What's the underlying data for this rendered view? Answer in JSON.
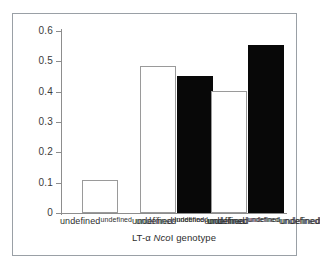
{
  "chart_data": {
    "type": "bar",
    "title": "",
    "xlabel": "LT-α NcoI genotype",
    "ylabel": "",
    "categories": [
      "B*1/B*1",
      "B*1/B*2",
      "B*2/B*2"
    ],
    "series": [
      {
        "name": "open",
        "fill": "white",
        "values": [
          0.109,
          0.485,
          0.403
        ]
      },
      {
        "name": "filled",
        "fill": "black",
        "values": [
          null,
          0.452,
          0.554
        ]
      }
    ],
    "ylim": [
      0,
      0.6
    ],
    "yticks": [
      0,
      0.1,
      0.2,
      0.3,
      0.4,
      0.5,
      0.6
    ],
    "ytick_labels": [
      "0",
      "0.1",
      "0.2",
      "0.3",
      "0.4",
      "0.5",
      "0.6"
    ],
    "grid": false,
    "legend": "none"
  },
  "axis": {
    "ytick_labels": [
      "0.6",
      "0.5",
      "0.4",
      "0.3",
      "0.2",
      "0.1",
      "0"
    ],
    "xlabel_parts": {
      "prefix": "LT-α ",
      "italic": "Nco",
      "suffix": "I genotype"
    }
  },
  "categories": [
    {
      "pre": "B",
      "star": "*",
      "mid": "1/B",
      "star2": "*",
      "post": "1",
      "full": "B*1/B*1"
    },
    {
      "pre": "B",
      "star": "*",
      "mid": "1/B",
      "star2": "*",
      "post": "2",
      "full": "B*1/B*2"
    },
    {
      "pre": "B",
      "star": "*",
      "mid": "2/B",
      "star2": "*",
      "post": "2",
      "full": "B*2/B*2"
    }
  ],
  "colors": {
    "open_bar_fill": "#ffffff",
    "open_bar_stroke": "#9a9a9a",
    "filled_bar": "#080808",
    "axis": "#8d8d8d",
    "frame": "#9aa0a6",
    "text": "#2e2e2e",
    "background": "#ffffff"
  }
}
